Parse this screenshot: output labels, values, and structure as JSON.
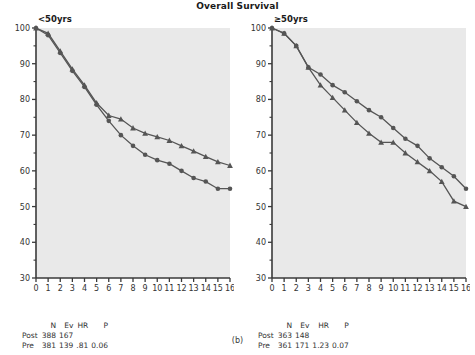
{
  "figure": {
    "title": "Overall Survival",
    "caption": "(b)"
  },
  "chart_data": [
    {
      "type": "line",
      "title": "<50yrs",
      "panel": "left",
      "xlabel": "",
      "ylabel": "",
      "xlim": [
        0,
        16
      ],
      "ylim": [
        30,
        100
      ],
      "xticks": [
        0,
        1,
        2,
        3,
        4,
        5,
        6,
        7,
        8,
        9,
        10,
        11,
        12,
        13,
        14,
        15,
        16
      ],
      "yticks": [
        30,
        40,
        50,
        60,
        70,
        80,
        90,
        100
      ],
      "grid": false,
      "legend": "none",
      "x": [
        0,
        1,
        2,
        3,
        4,
        5,
        6,
        7,
        8,
        9,
        10,
        11,
        12,
        13,
        14,
        15,
        16
      ],
      "series": [
        {
          "name": "Pre",
          "marker": "triangle",
          "color": "#555555",
          "values": [
            100,
            98.5,
            93.5,
            88.5,
            84,
            79,
            75.5,
            74.5,
            72,
            70.5,
            69.5,
            68.5,
            67,
            65.5,
            64,
            62.5,
            61.5
          ]
        },
        {
          "name": "Post",
          "marker": "circle",
          "color": "#555555",
          "values": [
            100,
            98,
            93,
            88,
            83.5,
            78.5,
            74,
            70,
            67,
            64.5,
            63,
            62,
            60,
            58,
            57,
            55,
            55
          ]
        }
      ],
      "stats": {
        "columns": [
          "",
          "N",
          "Ev",
          "HR",
          "P"
        ],
        "rows": [
          {
            "label": "Post",
            "N": "388",
            "Ev": "167",
            "HR": "",
            "P": ""
          },
          {
            "label": "Pre",
            "N": "381",
            "Ev": "139",
            "HR": ".81",
            "P": "0.06"
          }
        ]
      }
    },
    {
      "type": "line",
      "title": "≥50yrs",
      "panel": "right",
      "xlabel": "",
      "ylabel": "",
      "xlim": [
        0,
        16
      ],
      "ylim": [
        30,
        100
      ],
      "xticks": [
        0,
        1,
        2,
        3,
        4,
        5,
        6,
        7,
        8,
        9,
        10,
        11,
        12,
        13,
        14,
        15,
        16
      ],
      "yticks": [
        30,
        40,
        50,
        60,
        70,
        80,
        90,
        100
      ],
      "grid": false,
      "legend": "none",
      "x": [
        0,
        1,
        2,
        3,
        4,
        5,
        6,
        7,
        8,
        9,
        10,
        11,
        12,
        13,
        14,
        15,
        16
      ],
      "series": [
        {
          "name": "Post",
          "marker": "circle",
          "color": "#555555",
          "values": [
            100,
            98.5,
            95,
            89,
            87,
            84,
            82,
            79.5,
            77,
            75,
            72,
            69,
            67,
            63.5,
            61,
            58.5,
            55
          ]
        },
        {
          "name": "Pre",
          "marker": "triangle",
          "color": "#555555",
          "values": [
            100,
            98.5,
            95,
            89,
            84,
            80.5,
            77,
            73.5,
            70.5,
            68,
            68,
            65,
            62.5,
            60,
            57,
            51.5,
            50
          ]
        }
      ],
      "stats": {
        "columns": [
          "",
          "N",
          "Ev",
          "HR",
          "P"
        ],
        "rows": [
          {
            "label": "Post",
            "N": "363",
            "Ev": "148",
            "HR": "",
            "P": ""
          },
          {
            "label": "Pre",
            "N": "361",
            "Ev": "171",
            "HR": "1.23",
            "P": "0.07"
          }
        ]
      }
    }
  ]
}
